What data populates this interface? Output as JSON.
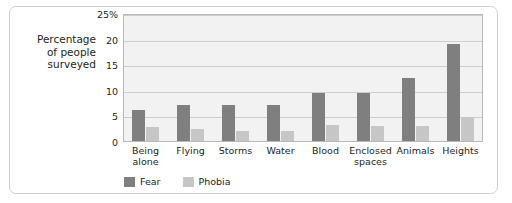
{
  "chart_data": {
    "type": "bar",
    "title": "",
    "xlabel": "",
    "ylabel": "Percentage\nof people\nsurveyed",
    "ylim": [
      0,
      25
    ],
    "yticks": [
      0,
      5,
      10,
      15,
      20,
      25
    ],
    "ytick_labels": [
      "0",
      "5",
      "10",
      "15",
      "20",
      "25%"
    ],
    "grid": true,
    "legend_position": "bottom-left",
    "categories": [
      "Being\nalone",
      "Flying",
      "Storms",
      "Water",
      "Blood",
      "Enclosed\nspaces",
      "Animals",
      "Heights"
    ],
    "series": [
      {
        "name": "Fear",
        "color": "#7f7f7f",
        "values": [
          6.0,
          7.0,
          7.0,
          7.1,
          9.4,
          9.3,
          12.4,
          19.0
        ]
      },
      {
        "name": "Phobia",
        "color": "#c6c6c6",
        "values": [
          2.7,
          2.4,
          2.0,
          1.9,
          3.1,
          3.0,
          3.0,
          4.6
        ]
      }
    ]
  },
  "colors": {
    "fear": "#7f7f7f",
    "phobia": "#c6c6c6",
    "plot_background": "#f2f2f2",
    "gridline": "#cdcdcd",
    "frame_border": "#cfcfcf",
    "text": "#231f20"
  }
}
